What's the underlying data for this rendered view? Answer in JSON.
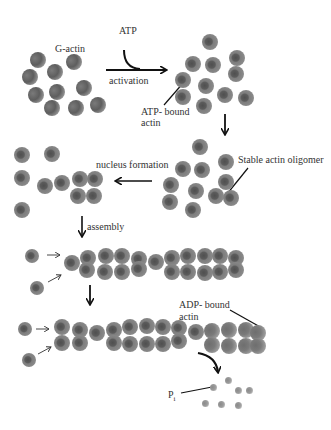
{
  "labels": {
    "g_actin": "G-actin",
    "atp": "ATP",
    "activation": "activation",
    "atp_bound_line1": "ATP- bound",
    "atp_bound_line2": "actin",
    "stable_oligomer": "Stable actin oligomer",
    "nucleus_formation": "nucleus formation",
    "assembly": "assembly",
    "adp_bound_line1": "ADP- bound",
    "adp_bound_line2": "actin",
    "pi": "P",
    "pi_sub": "i"
  },
  "stages": {
    "g_actin": [
      [
        38,
        60
      ],
      [
        74,
        62
      ],
      [
        30,
        77
      ],
      [
        55,
        72
      ],
      [
        36,
        95
      ],
      [
        57,
        92
      ],
      [
        84,
        88
      ],
      [
        52,
        108
      ],
      [
        76,
        108
      ],
      [
        98,
        105
      ]
    ],
    "atp_bound": [
      [
        210,
        42
      ],
      [
        193,
        64
      ],
      [
        213,
        65
      ],
      [
        237,
        58
      ],
      [
        183,
        80
      ],
      [
        206,
        86
      ],
      [
        236,
        74
      ],
      [
        183,
        97
      ],
      [
        225,
        95
      ],
      [
        246,
        98
      ],
      [
        204,
        106
      ]
    ],
    "oligomer": [
      [
        200,
        147
      ],
      [
        183,
        169
      ],
      [
        202,
        170
      ],
      [
        226,
        162
      ],
      [
        171,
        185
      ],
      [
        196,
        191
      ],
      [
        226,
        182
      ],
      [
        170,
        202
      ],
      [
        216,
        196
      ],
      [
        231,
        198
      ],
      [
        193,
        210
      ]
    ],
    "nucleus": [
      [
        22,
        155
      ],
      [
        52,
        154
      ],
      [
        22,
        178
      ],
      [
        45,
        186
      ],
      [
        62,
        183
      ],
      [
        80,
        179
      ],
      [
        95,
        179
      ],
      [
        78,
        196
      ],
      [
        94,
        196
      ],
      [
        22,
        210
      ]
    ],
    "filament1_free": [
      [
        32,
        256
      ],
      [
        37,
        288
      ]
    ],
    "filament1_top": [
      [
        72,
        263
      ],
      [
        88,
        258
      ],
      [
        106,
        256
      ],
      [
        122,
        256
      ],
      [
        139,
        259
      ],
      [
        156,
        262
      ],
      [
        172,
        258
      ],
      [
        188,
        256
      ],
      [
        205,
        256
      ],
      [
        220,
        256
      ],
      [
        236,
        258
      ]
    ],
    "filament1_bottom": [
      [
        87,
        270
      ],
      [
        105,
        272
      ],
      [
        122,
        272
      ],
      [
        139,
        269
      ],
      [
        172,
        272
      ],
      [
        188,
        272
      ],
      [
        205,
        273
      ],
      [
        220,
        272
      ],
      [
        236,
        270
      ]
    ],
    "filament2_free": [
      [
        25,
        329
      ],
      [
        29,
        360
      ]
    ],
    "filament2_top": [
      [
        62,
        327
      ],
      [
        80,
        330
      ],
      [
        97,
        333
      ],
      [
        114,
        330
      ],
      [
        130,
        327
      ],
      [
        147,
        326
      ],
      [
        163,
        327
      ],
      [
        179,
        328
      ],
      [
        196,
        332
      ]
    ],
    "filament2_bottom": [
      [
        62,
        343
      ],
      [
        80,
        343
      ],
      [
        114,
        343
      ],
      [
        130,
        344
      ],
      [
        147,
        344
      ],
      [
        163,
        344
      ],
      [
        179,
        341
      ]
    ],
    "filament2_adp": [
      [
        212,
        331
      ],
      [
        229,
        330
      ],
      [
        246,
        330
      ],
      [
        258,
        333
      ],
      [
        212,
        345
      ],
      [
        229,
        346
      ],
      [
        246,
        346
      ],
      [
        258,
        346
      ]
    ],
    "pi_dots": [
      [
        213,
        387
      ],
      [
        228,
        380
      ],
      [
        238,
        390
      ],
      [
        249,
        390
      ],
      [
        205,
        403
      ],
      [
        221,
        404
      ],
      [
        238,
        405
      ]
    ]
  }
}
